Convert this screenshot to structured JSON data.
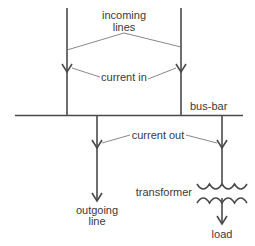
{
  "diagram": {
    "labels": {
      "incoming_line1": "incoming",
      "incoming_line2": "lines",
      "current_in": "current in",
      "bus_bar": "bus-bar",
      "current_out": "current out",
      "transformer": "transformer",
      "outgoing_line1": "outgoing",
      "outgoing_line2": "line",
      "load": "load"
    },
    "colors": {
      "line": "#4a4a4a",
      "leader": "#6a6a6a",
      "text": "#3a3a3a"
    }
  }
}
